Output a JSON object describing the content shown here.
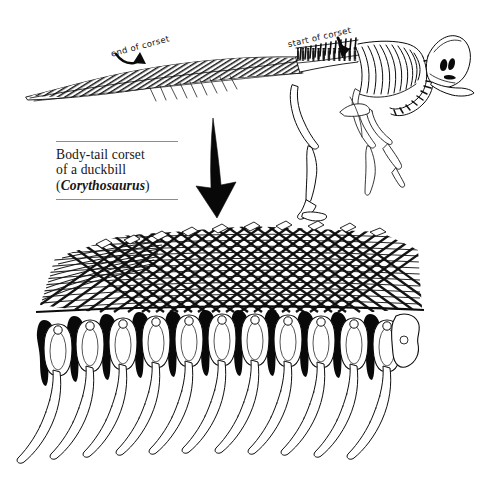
{
  "figure": {
    "domain": "scientific-illustration",
    "background_color": "#ffffff",
    "ink_color": "#000000",
    "caption": {
      "line1": "Body-tail corset",
      "line2": "of a duckbill",
      "genus_open": "(",
      "genus": "Corythosaurus",
      "genus_close": ")",
      "rule_color": "#8d8d8d"
    },
    "annotations": [
      {
        "id": "end-of-corset",
        "label": "end of corset",
        "arrow": "curved-arrow-down-right",
        "points_to": "tail ossified tendons"
      },
      {
        "id": "start-of-corset",
        "label": "start of corset",
        "arrow": "straight-arrow-down",
        "points_to": "dorsal vertebrae over hips"
      }
    ],
    "zoom_arrow": {
      "id": "magnify-arrow",
      "direction": "down",
      "color": "#080808",
      "meaning": "detail enlargement of corset region"
    },
    "upper_panel": {
      "name": "full-skeleton-lateral-view",
      "parts": [
        "skull-with-crest",
        "cervical-vertebrae",
        "dorsal-vertebrae",
        "ribcage",
        "ossified-tendon-lattice",
        "tail-vertebrae",
        "femur",
        "tibia-fibula",
        "hind-foot",
        "forelimb"
      ]
    },
    "lower_panel": {
      "name": "corset-detail-enlargement",
      "parts": [
        "ossified-tendon-lattice",
        "neural-spines",
        "vertebral-centra",
        "rib-facets",
        "ribs"
      ],
      "vertebra_count": 12,
      "rib_count": 11
    }
  }
}
